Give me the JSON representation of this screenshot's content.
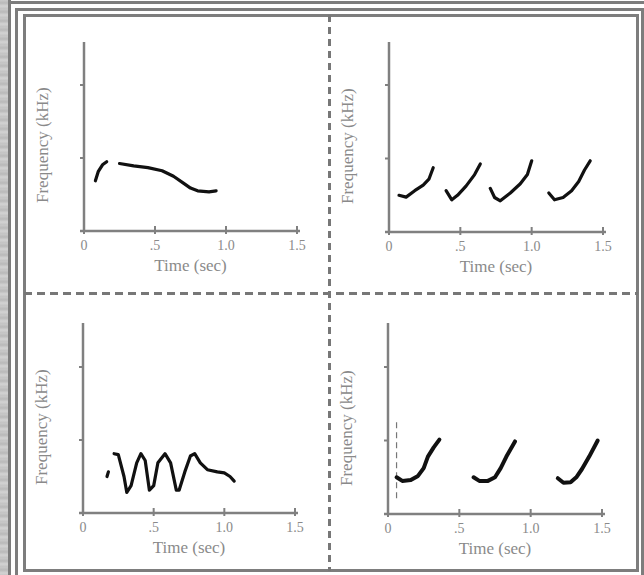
{
  "figure": {
    "frame_color": "#7d7d7d",
    "divider_color": "#777777",
    "axis_color": "#808080",
    "trace_color": "#111111",
    "label_color": "#8a8a8a"
  },
  "chart_data": [
    {
      "type": "line",
      "title": "",
      "panel": "top-left",
      "xlabel": "Time (sec)",
      "ylabel": "Frequency (kHz)",
      "xlim": [
        0,
        1.5
      ],
      "ylim": [
        0,
        40
      ],
      "xticks": [
        0,
        0.5,
        1.0,
        1.5
      ],
      "xtick_labels": [
        "0",
        ".5",
        "1.0",
        "1.5"
      ],
      "yticks": [
        0,
        16,
        32
      ],
      "ytick_labels": [
        "0",
        "16",
        "32"
      ],
      "grid": false,
      "series": [
        {
          "name": "segment-1",
          "x": [
            0.08,
            0.1,
            0.13,
            0.16
          ],
          "y": [
            11,
            13,
            14.5,
            15.2
          ]
        },
        {
          "name": "segment-2",
          "x": [
            0.25,
            0.35,
            0.45,
            0.55,
            0.63,
            0.7,
            0.75,
            0.8,
            0.88,
            0.93
          ],
          "y": [
            14.8,
            14.3,
            13.9,
            13.2,
            12,
            10.5,
            9.4,
            8.8,
            8.6,
            8.8
          ]
        }
      ]
    },
    {
      "type": "line",
      "title": "",
      "panel": "top-right",
      "xlabel": "Time (sec)",
      "ylabel": "Frequency (kHz)",
      "xlim": [
        0,
        1.5
      ],
      "ylim": [
        0,
        40
      ],
      "xticks": [
        0,
        0.5,
        1.0,
        1.5
      ],
      "xtick_labels": [
        "0",
        ".5",
        "1.0",
        "1.5"
      ],
      "yticks": [
        0,
        16,
        32
      ],
      "ytick_labels": [
        "0",
        "16",
        "32"
      ],
      "grid": false,
      "series": [
        {
          "name": "note-1",
          "x": [
            0.07,
            0.12,
            0.18,
            0.24,
            0.28,
            0.31
          ],
          "y": [
            8,
            7.6,
            9,
            10.2,
            11.5,
            14
          ]
        },
        {
          "name": "note-2",
          "x": [
            0.4,
            0.44,
            0.48,
            0.54,
            0.6,
            0.64
          ],
          "y": [
            9,
            7,
            8,
            10,
            12.5,
            14.8
          ]
        },
        {
          "name": "note-3",
          "x": [
            0.71,
            0.74,
            0.78,
            0.85,
            0.92,
            0.97,
            1.0
          ],
          "y": [
            9.5,
            7.5,
            6.8,
            8.5,
            10.5,
            12.5,
            15.5
          ]
        },
        {
          "name": "note-4",
          "x": [
            1.12,
            1.16,
            1.22,
            1.28,
            1.33,
            1.37,
            1.41
          ],
          "y": [
            8.5,
            7,
            7.5,
            9,
            11,
            13.5,
            15.5
          ]
        }
      ]
    },
    {
      "type": "line",
      "title": "",
      "panel": "bottom-left",
      "xlabel": "Time (sec)",
      "ylabel": "Frequency (kHz)",
      "xlim": [
        0,
        1.5
      ],
      "ylim": [
        0,
        40
      ],
      "xticks": [
        0,
        0.5,
        1.0,
        1.5
      ],
      "xtick_labels": [
        "0",
        ".5",
        "1.0",
        "1.5"
      ],
      "yticks": [
        0,
        16,
        32
      ],
      "ytick_labels": [
        "0",
        "16",
        "32"
      ],
      "grid": false,
      "series": [
        {
          "name": "start",
          "x": [
            0.17,
            0.18
          ],
          "y": [
            8,
            9
          ]
        },
        {
          "name": "oscillation",
          "x": [
            0.22,
            0.25,
            0.29,
            0.31,
            0.34,
            0.38,
            0.41,
            0.44,
            0.47,
            0.5,
            0.53,
            0.58,
            0.62,
            0.66,
            0.68,
            0.72,
            0.76,
            0.79,
            0.83,
            0.88,
            0.95,
            1.0,
            1.04,
            1.07
          ],
          "y": [
            13,
            12.8,
            8,
            4.5,
            6,
            11,
            13,
            11.5,
            5,
            6,
            11,
            13,
            11,
            5,
            5,
            9,
            12.5,
            13,
            11,
            9.5,
            9,
            8.8,
            8,
            7
          ]
        }
      ]
    },
    {
      "type": "line",
      "title": "",
      "panel": "bottom-right",
      "xlabel": "Time (sec)",
      "ylabel": "Frequency (kHz)",
      "xlim": [
        0,
        1.5
      ],
      "ylim": [
        0,
        40
      ],
      "xticks": [
        0,
        0.5,
        1.0,
        1.5
      ],
      "xtick_labels": [
        "0",
        ".5",
        "1.0",
        "1.5"
      ],
      "yticks": [
        0,
        16,
        32
      ],
      "ytick_labels": [
        "0",
        "16",
        "32"
      ],
      "grid": false,
      "annotations": [
        {
          "type": "dashed-vertical-marker",
          "x": 0.06,
          "y_range": [
            3,
            20
          ]
        }
      ],
      "series": [
        {
          "name": "note-1",
          "x": [
            0.06,
            0.1,
            0.16,
            0.21,
            0.25,
            0.28,
            0.32,
            0.36
          ],
          "y": [
            8,
            7.2,
            7.4,
            8.3,
            10,
            12.5,
            14.5,
            16.2
          ]
        },
        {
          "name": "note-2",
          "x": [
            0.6,
            0.64,
            0.7,
            0.75,
            0.79,
            0.83,
            0.89
          ],
          "y": [
            8,
            7.2,
            7.2,
            8,
            10,
            12.5,
            15.8
          ]
        },
        {
          "name": "note-3",
          "x": [
            1.19,
            1.23,
            1.28,
            1.32,
            1.36,
            1.41,
            1.47
          ],
          "y": [
            7.8,
            6.8,
            6.9,
            8,
            9.8,
            12.5,
            16
          ]
        }
      ]
    }
  ]
}
